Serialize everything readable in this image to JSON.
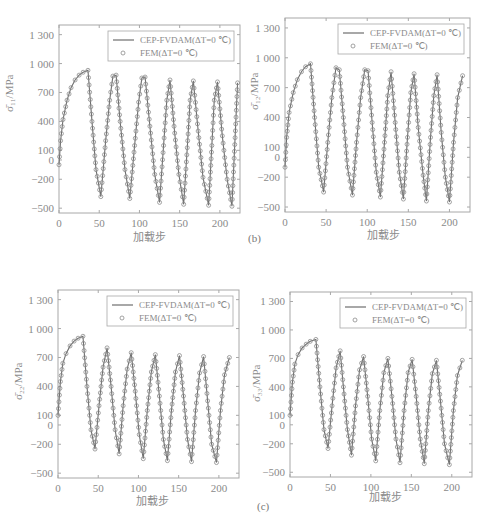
{
  "figure_labels": {
    "b": "(b)",
    "c": "(c)"
  },
  "legend": {
    "line_label": "CEP-FVDAM(ΔT=0 ℃)",
    "marker_label": "FEM(ΔT=0 ℃)"
  },
  "colors": {
    "line": "#6e6e6e",
    "marker": "#8c8c8c",
    "frame": "#a8a8a8",
    "text": "#8a8a8a"
  },
  "chart_data": [
    {
      "type": "line",
      "title": "",
      "xlabel": "加载步",
      "ylabel": "σ̄₁₁/MPa",
      "xlim": [
        0,
        225
      ],
      "ylim": [
        -550,
        1400
      ],
      "xticks": [
        0,
        50,
        100,
        150,
        200
      ],
      "yticks": [
        1300,
        1000,
        700,
        400,
        100,
        0,
        -200,
        -500
      ],
      "ytick_labels": [
        "1 300",
        "1 000",
        "700",
        "400",
        "100",
        "0",
        "−200",
        "−500"
      ],
      "grid": false,
      "legend_position": "upper right",
      "series": [
        {
          "name": "CEP-FVDAM(ΔT=0 ℃)",
          "style": "line",
          "x": [
            0,
            2,
            5,
            10,
            15,
            20,
            25,
            30,
            36,
            41,
            46,
            52,
            58,
            63,
            67,
            71,
            76,
            82,
            88,
            94,
            99,
            103,
            107,
            113,
            119,
            125,
            130,
            134,
            138,
            143,
            149,
            155,
            160,
            163,
            167,
            173,
            179,
            186,
            190,
            193,
            197,
            203,
            209,
            215,
            222
          ],
          "y": [
            -50,
            200,
            420,
            620,
            750,
            830,
            880,
            910,
            930,
            400,
            -100,
            -380,
            200,
            620,
            870,
            880,
            400,
            -100,
            -400,
            150,
            600,
            850,
            860,
            350,
            -150,
            -440,
            150,
            620,
            830,
            350,
            -150,
            -460,
            200,
            620,
            820,
            300,
            -180,
            -470,
            150,
            620,
            810,
            250,
            -200,
            -480,
            800
          ]
        },
        {
          "name": "FEM(ΔT=0 ℃)",
          "style": "markers",
          "marker": "circle",
          "note": "coincides with CEP-FVDAM curve"
        }
      ],
      "peaks": [
        930,
        880,
        860,
        830,
        820,
        810,
        800
      ],
      "valleys": [
        -380,
        -400,
        -440,
        -460,
        -470,
        -480
      ]
    },
    {
      "type": "line",
      "panel_label": "(b)",
      "xlabel": "加载步",
      "ylabel": "σ̄₁₂/MPa",
      "xlim": [
        0,
        225
      ],
      "ylim": [
        -550,
        1400
      ],
      "xticks": [
        0,
        50,
        100,
        150,
        200
      ],
      "yticks": [
        1300,
        1000,
        700,
        400,
        100,
        0,
        -200,
        -500
      ],
      "ytick_labels": [
        "1 300",
        "1 000",
        "700",
        "400",
        "100",
        "0",
        "−200",
        "−500"
      ],
      "grid": false,
      "legend_position": "upper right",
      "series": [
        {
          "name": "CEP-FVDAM(ΔT=0 ℃)",
          "style": "line",
          "x": [
            0,
            2,
            5,
            10,
            15,
            20,
            25,
            31,
            36,
            41,
            47,
            52,
            57,
            62,
            66,
            71,
            76,
            82,
            87,
            92,
            97,
            101,
            106,
            111,
            116,
            121,
            125,
            129,
            134,
            139,
            144,
            149,
            153,
            157,
            162,
            168,
            172,
            177,
            181,
            185,
            190,
            195,
            200,
            205,
            210,
            216
          ],
          "y": [
            -100,
            200,
            450,
            650,
            780,
            860,
            910,
            940,
            400,
            -100,
            -350,
            150,
            600,
            900,
            880,
            400,
            -100,
            -380,
            150,
            600,
            880,
            870,
            350,
            -150,
            -400,
            150,
            620,
            860,
            350,
            -150,
            -420,
            200,
            650,
            840,
            300,
            -180,
            -440,
            200,
            620,
            830,
            250,
            -200,
            -450,
            150,
            600,
            820
          ]
        },
        {
          "name": "FEM(ΔT=0 ℃)",
          "style": "markers",
          "marker": "circle"
        }
      ],
      "peaks": [
        940,
        900,
        880,
        860,
        840,
        830,
        820
      ],
      "valleys": [
        -350,
        -380,
        -400,
        -420,
        -440,
        -450
      ]
    },
    {
      "type": "line",
      "xlabel": "加载步",
      "ylabel": "σ̄₂₂/MPa",
      "xlim": [
        0,
        225
      ],
      "ylim": [
        -550,
        1400
      ],
      "xticks": [
        0,
        50,
        100,
        150,
        200
      ],
      "yticks": [
        1300,
        1000,
        700,
        400,
        100,
        0,
        -200,
        -500
      ],
      "ytick_labels": [
        "1 300",
        "1 000",
        "700",
        "400",
        "100",
        "0",
        "−200",
        "−500"
      ],
      "grid": false,
      "legend_position": "upper right",
      "series": [
        {
          "name": "CEP-FVDAM(ΔT=0 ℃)",
          "style": "line",
          "x": [
            0,
            3,
            6,
            10,
            15,
            20,
            25,
            31,
            36,
            41,
            46,
            51,
            56,
            61,
            66,
            71,
            76,
            81,
            86,
            91,
            96,
            101,
            106,
            111,
            116,
            121,
            126,
            131,
            136,
            141,
            146,
            151,
            156,
            161,
            166,
            171,
            176,
            181,
            186,
            191,
            197,
            202,
            207,
            213
          ],
          "y": [
            100,
            450,
            640,
            740,
            820,
            870,
            900,
            920,
            400,
            -50,
            -250,
            200,
            600,
            800,
            400,
            -50,
            -300,
            200,
            580,
            750,
            350,
            -100,
            -350,
            150,
            550,
            730,
            300,
            -150,
            -370,
            150,
            550,
            720,
            300,
            -150,
            -380,
            150,
            540,
            710,
            250,
            -200,
            -390,
            150,
            520,
            700
          ]
        },
        {
          "name": "FEM(ΔT=0 ℃)",
          "style": "markers",
          "marker": "circle"
        }
      ],
      "peaks": [
        920,
        800,
        750,
        730,
        720,
        710,
        700
      ],
      "valleys": [
        -250,
        -300,
        -350,
        -370,
        -380,
        -390
      ]
    },
    {
      "type": "line",
      "panel_label": "(c)",
      "xlabel": "加载步",
      "ylabel": "σ̄₃₃/MPa",
      "xlim": [
        0,
        225
      ],
      "ylim": [
        -550,
        1400
      ],
      "xticks": [
        0,
        50,
        100,
        150,
        200
      ],
      "yticks": [
        1300,
        1000,
        700,
        400,
        100,
        0,
        -200,
        -500
      ],
      "ytick_labels": [
        "1 300",
        "1 000",
        "700",
        "400",
        "100",
        "0",
        "−200",
        "−500"
      ],
      "grid": false,
      "legend_position": "upper right",
      "series": [
        {
          "name": "CEP-FVDAM(ΔT=0 ℃)",
          "style": "line",
          "x": [
            0,
            3,
            6,
            10,
            15,
            20,
            25,
            32,
            37,
            42,
            47,
            52,
            57,
            62,
            66,
            71,
            76,
            81,
            86,
            91,
            96,
            101,
            106,
            111,
            116,
            121,
            126,
            131,
            136,
            141,
            146,
            151,
            156,
            161,
            166,
            171,
            176,
            181,
            186,
            191,
            197,
            202,
            207,
            213
          ],
          "y": [
            100,
            450,
            640,
            740,
            810,
            850,
            880,
            900,
            400,
            -50,
            -250,
            200,
            600,
            780,
            400,
            -50,
            -320,
            200,
            580,
            720,
            300,
            -150,
            -380,
            150,
            550,
            700,
            300,
            -150,
            -400,
            150,
            550,
            690,
            300,
            -150,
            -410,
            150,
            540,
            680,
            250,
            -200,
            -420,
            150,
            520,
            680
          ]
        },
        {
          "name": "FEM(ΔT=0 ℃)",
          "style": "markers",
          "marker": "circle"
        }
      ],
      "peaks": [
        900,
        780,
        720,
        700,
        690,
        680,
        680
      ],
      "valleys": [
        -250,
        -320,
        -380,
        -400,
        -410,
        -420
      ]
    }
  ]
}
